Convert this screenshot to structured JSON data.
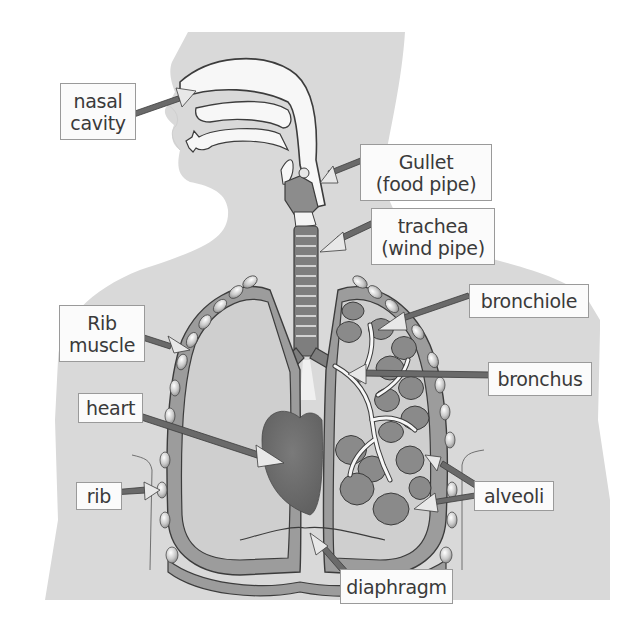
{
  "diagram": {
    "labels": {
      "nasal_cavity": {
        "line1": "nasal",
        "line2": "cavity"
      },
      "gullet": {
        "line1": "Gullet",
        "line2": "(food pipe)"
      },
      "trachea": {
        "line1": "trachea",
        "line2": "(wind pipe)"
      },
      "bronchiole": {
        "line1": "bronchiole"
      },
      "bronchus": {
        "line1": "bronchus"
      },
      "rib_muscle": {
        "line1": "Rib",
        "line2": "muscle"
      },
      "heart": {
        "line1": "heart"
      },
      "rib": {
        "line1": "rib"
      },
      "alveoli": {
        "line1": "alveoli"
      },
      "diaphragm": {
        "line1": "diaphragm"
      }
    },
    "colors": {
      "background": "#ffffff",
      "body_silhouette": "#d9d9d9",
      "lung_fill": "#cfcfcf",
      "pleura": "#9c9c9c",
      "organ_dark": "#7e7e7e",
      "heart": "#6f6f6f",
      "airway_white": "#f7f7f7",
      "outline": "#3c3c3c",
      "arrow_dark": "#6a6a6a",
      "arrow_light": "#e8e8e8",
      "label_border": "#9a9a9a",
      "label_text": "#3a3a3a"
    }
  }
}
